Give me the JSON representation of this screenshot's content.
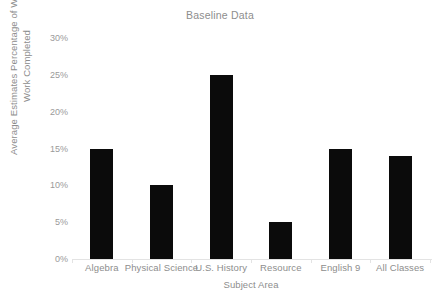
{
  "chart_data": {
    "type": "bar",
    "title": "Baseline Data",
    "xlabel": "Subject Area",
    "ylabel": "Average Estimates Percentage of Written\nWork Completed",
    "categories": [
      "Algebra",
      "Physical Science",
      "U.S. History",
      "Resource",
      "English 9",
      "All Classes"
    ],
    "values": [
      15,
      10,
      25,
      5,
      15,
      14
    ],
    "value_labels": [
      "15%",
      "10%",
      "25%",
      "5%",
      "15%",
      "14%"
    ],
    "ylim": [
      0,
      30
    ],
    "ytick_values": [
      0,
      5,
      10,
      15,
      20,
      25,
      30
    ],
    "ytick_labels": [
      "0%",
      "5%",
      "10%",
      "15%",
      "20%",
      "25%",
      "30%"
    ],
    "grid": false,
    "legend": null,
    "bar_color": "#0b0b0b",
    "axis_color": "#e3e3e3",
    "text_color": "#8d8d8d"
  }
}
